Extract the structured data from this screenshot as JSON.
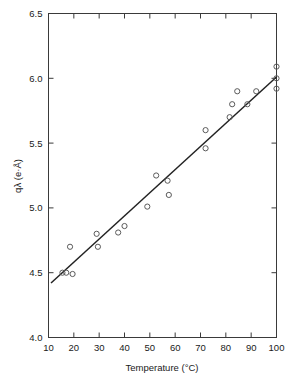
{
  "chart_data": {
    "type": "scatter",
    "title": "",
    "xlabel": "Temperature (°C)",
    "ylabel": "qλ (e·Å)",
    "xlim": [
      10,
      100
    ],
    "ylim": [
      4.0,
      6.5
    ],
    "xticks": [
      10,
      20,
      30,
      40,
      50,
      60,
      70,
      80,
      90,
      100
    ],
    "xtick_labels": [
      "10",
      "20",
      "30",
      "40",
      "50",
      "60",
      "70",
      "80",
      "90",
      "100"
    ],
    "yticks": [
      4.0,
      4.5,
      5.0,
      5.5,
      6.0,
      6.5
    ],
    "ytick_labels": [
      "4.0",
      "4.5",
      "5.0",
      "5.5",
      "6.0",
      "6.5"
    ],
    "grid": false,
    "legend": null,
    "marker_style": "open-circle",
    "frame": "box-all-sides-inward-ticks",
    "points": [
      {
        "x": 15.5,
        "y": 4.5
      },
      {
        "x": 17.0,
        "y": 4.5
      },
      {
        "x": 18.5,
        "y": 4.7
      },
      {
        "x": 19.5,
        "y": 4.49
      },
      {
        "x": 29.0,
        "y": 4.8
      },
      {
        "x": 29.5,
        "y": 4.7
      },
      {
        "x": 37.5,
        "y": 4.81
      },
      {
        "x": 40.0,
        "y": 4.86
      },
      {
        "x": 49.0,
        "y": 5.01
      },
      {
        "x": 52.5,
        "y": 5.25
      },
      {
        "x": 57.0,
        "y": 5.21
      },
      {
        "x": 57.5,
        "y": 5.1
      },
      {
        "x": 72.0,
        "y": 5.6
      },
      {
        "x": 72.0,
        "y": 5.46
      },
      {
        "x": 81.5,
        "y": 5.7
      },
      {
        "x": 82.5,
        "y": 5.8
      },
      {
        "x": 84.5,
        "y": 5.9
      },
      {
        "x": 88.5,
        "y": 5.8
      },
      {
        "x": 92.0,
        "y": 5.9
      },
      {
        "x": 100.0,
        "y": 6.09
      },
      {
        "x": 100.0,
        "y": 6.0
      },
      {
        "x": 100.0,
        "y": 5.92
      }
    ],
    "fit_line": {
      "type": "linear",
      "x_start": 11.0,
      "y_start": 4.42,
      "x_end": 100.0,
      "y_end": 6.01
    }
  }
}
